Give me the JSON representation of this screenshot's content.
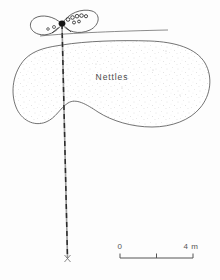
{
  "figure": {
    "background_color": "#fdfdfd",
    "ink_color": "#3b3b3b",
    "stipple_color": "#bdbdbd",
    "vegetation_patch": {
      "label": "Nettles",
      "fill_style": "stipple",
      "outline_color": "#4f4f4f"
    },
    "transect": {
      "style": "dashed",
      "orientation": "vertical",
      "color": "#2b2b2b"
    },
    "loop_feature": {
      "style": "chain-of-circles",
      "node_color": "#161616"
    },
    "scale_bar": {
      "start_label": "0",
      "end_label": "4 m",
      "ticks": 3,
      "color": "#555555"
    }
  }
}
